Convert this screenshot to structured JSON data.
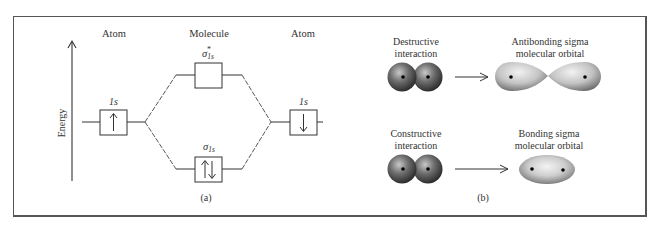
{
  "figure": {
    "panel_a": {
      "label": "(a)",
      "column_headers": {
        "left_atom": "Atom",
        "molecule": "Molecule",
        "right_atom": "Atom"
      },
      "axis_label": "Energy",
      "orbitals": {
        "left_atom": {
          "name": "1s",
          "electrons": "↑"
        },
        "right_atom": {
          "name": "1s",
          "electrons": "↓"
        },
        "antibonding": {
          "symbol": "σ",
          "subscript": "1s",
          "superscript": "*",
          "electrons": ""
        },
        "bonding": {
          "symbol": "σ",
          "subscript": "1s",
          "electrons": "↑↓"
        }
      }
    },
    "panel_b": {
      "label": "(b)",
      "rows": [
        {
          "interaction_label": "Destructive interaction",
          "result_label": "Antibonding sigma molecular orbital"
        },
        {
          "interaction_label": "Constructive interaction",
          "result_label": "Bonding sigma molecular orbital"
        }
      ]
    },
    "colors": {
      "line": "#3a3a3a",
      "frame": "#555555",
      "sphere_dark": "#2b2b2b",
      "sphere_light": "#bdbdbd",
      "orbital_light": "#e6e6e6",
      "orbital_dark": "#7a7a7a"
    }
  }
}
